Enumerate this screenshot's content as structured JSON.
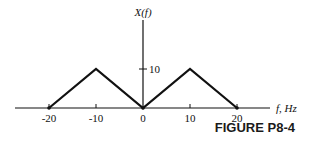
{
  "figure": {
    "caption": "FIGURE P8-4",
    "ylabel": "X(f)",
    "xlabel": "f, Hz"
  },
  "chart_data": {
    "type": "line",
    "title": "",
    "xlabel": "f, Hz",
    "ylabel": "X(f)",
    "x": [
      -20,
      -10,
      0,
      10,
      20
    ],
    "series": [
      {
        "name": "X(f)",
        "values": [
          0,
          10,
          0,
          10,
          0
        ]
      }
    ],
    "x_ticks": [
      "-20",
      "-10",
      "0",
      "10",
      "20"
    ],
    "y_ticks": [
      "10"
    ],
    "xlim": [
      -28,
      28
    ],
    "ylim": [
      0,
      23
    ],
    "grid": false,
    "legend": "none",
    "caption": "FIGURE P8-4"
  }
}
